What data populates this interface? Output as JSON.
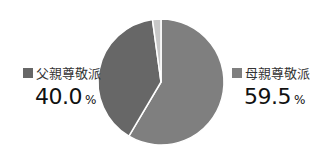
{
  "chart_data": {
    "type": "pie",
    "title": "",
    "start_angle_deg": 0,
    "direction": "clockwise",
    "slices": [
      {
        "label": "母親尊敬派",
        "value": 59.5,
        "color": "#7f7f7f",
        "display": "59.5",
        "unit": "%"
      },
      {
        "label": "父親尊敬派",
        "value": 40.0,
        "color": "#676767",
        "display": "40.0",
        "unit": "%"
      },
      {
        "label": "",
        "value": 0.5,
        "color": "#c8c8c8",
        "display": "",
        "unit": ""
      }
    ],
    "legend": [
      {
        "label": "父親尊敬派",
        "value": "40.0",
        "unit": "%",
        "color": "#676767",
        "position": "left"
      },
      {
        "label": "母親尊敬派",
        "value": "59.5",
        "unit": "%",
        "color": "#7f7f7f",
        "position": "right"
      }
    ]
  }
}
